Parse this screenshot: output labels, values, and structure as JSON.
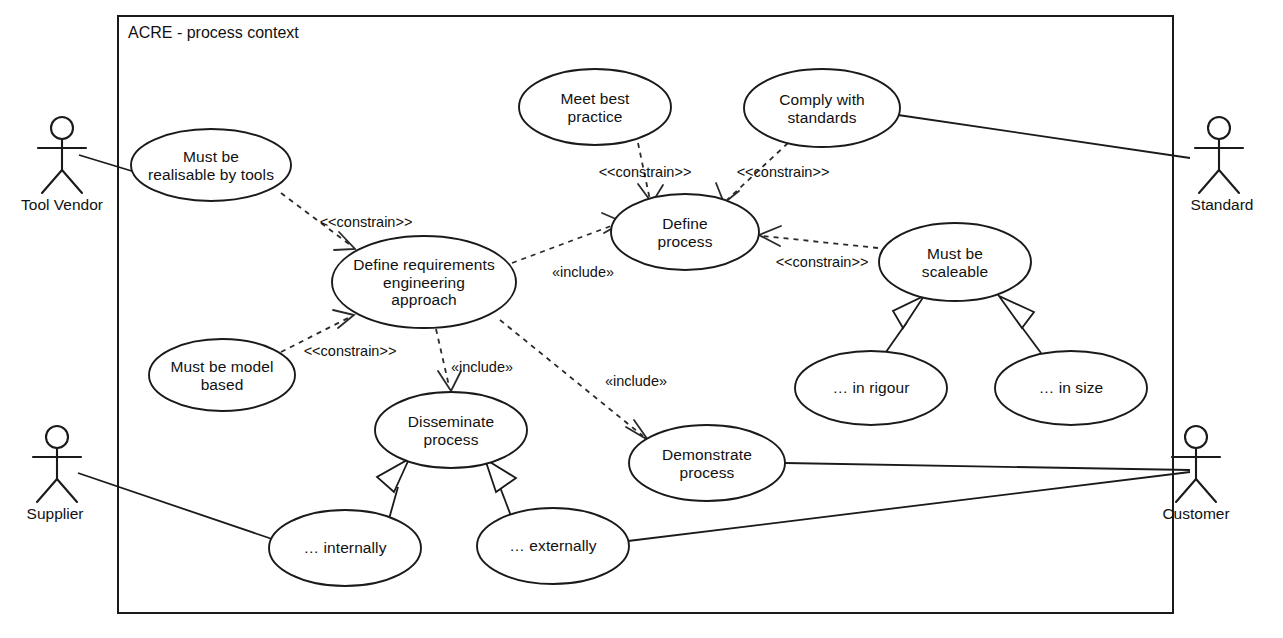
{
  "diagram": {
    "title": "ACRE - process context",
    "type": "uml-use-case-diagram",
    "boundary": {
      "x": 118,
      "y": 16,
      "width": 1055,
      "height": 597
    },
    "actors": [
      {
        "id": "tool-vendor",
        "label": "Tool Vendor",
        "cx": 62,
        "cy": 160
      },
      {
        "id": "standard",
        "label": "Standard",
        "cx": 1219,
        "cy": 160
      },
      {
        "id": "supplier",
        "label": "Supplier",
        "cx": 57,
        "cy": 470
      },
      {
        "id": "customer",
        "label": "Customer",
        "cx": 1196,
        "cy": 470
      }
    ],
    "use_cases": [
      {
        "id": "must-be-realisable-by-tools",
        "label": "Must be\nrealisable by tools",
        "cx": 211,
        "cy": 165,
        "rx": 80,
        "ry": 36
      },
      {
        "id": "meet-best-practice",
        "label": "Meet best\npractice",
        "cx": 595,
        "cy": 107,
        "rx": 76,
        "ry": 38
      },
      {
        "id": "comply-with-standards",
        "label": "Comply with\nstandards",
        "cx": 822,
        "cy": 108,
        "rx": 78,
        "ry": 39
      },
      {
        "id": "define-process",
        "label": "Define\nprocess",
        "cx": 685,
        "cy": 232,
        "rx": 74,
        "ry": 38
      },
      {
        "id": "must-be-scaleable",
        "label": "Must be\nscaleable",
        "cx": 955,
        "cy": 262,
        "rx": 76,
        "ry": 39
      },
      {
        "id": "define-re-approach",
        "label": "Define requirements\nengineering\napproach",
        "cx": 424,
        "cy": 282,
        "rx": 92,
        "ry": 46
      },
      {
        "id": "must-be-model-based",
        "label": "Must be model\nbased",
        "cx": 222,
        "cy": 375,
        "rx": 73,
        "ry": 36
      },
      {
        "id": "in-rigour",
        "label": "… in rigour",
        "cx": 871,
        "cy": 388,
        "rx": 76,
        "ry": 37
      },
      {
        "id": "in-size",
        "label": "… in size",
        "cx": 1071,
        "cy": 388,
        "rx": 76,
        "ry": 37
      },
      {
        "id": "disseminate-process",
        "label": "Disseminate\nprocess",
        "cx": 451,
        "cy": 430,
        "rx": 76,
        "ry": 38
      },
      {
        "id": "demonstrate-process",
        "label": "Demonstrate\nprocess",
        "cx": 707,
        "cy": 463,
        "rx": 78,
        "ry": 38
      },
      {
        "id": "internally",
        "label": "… internally",
        "cx": 345,
        "cy": 548,
        "rx": 76,
        "ry": 38
      },
      {
        "id": "externally",
        "label": "… externally",
        "cx": 553,
        "cy": 546,
        "rx": 76,
        "ry": 38
      }
    ],
    "relationship_labels": [
      {
        "id": "constrain-tools-to-approach",
        "text": "<<constrain>>",
        "x": 366,
        "y": 222
      },
      {
        "id": "constrain-best-practice",
        "text": "<<constrain>>",
        "x": 645,
        "y": 172
      },
      {
        "id": "constrain-standards",
        "text": "<<constrain>>",
        "x": 783,
        "y": 172
      },
      {
        "id": "constrain-scaleable",
        "text": "<<constrain>>",
        "x": 822,
        "y": 262
      },
      {
        "id": "constrain-model-based",
        "text": "<<constrain>>",
        "x": 350,
        "y": 351
      },
      {
        "id": "include-define-process",
        "text": "«include»",
        "x": 583,
        "y": 272
      },
      {
        "id": "include-disseminate",
        "text": "«include»",
        "x": 482,
        "y": 367
      },
      {
        "id": "include-demonstrate",
        "text": "«include»",
        "x": 636,
        "y": 381
      }
    ]
  }
}
